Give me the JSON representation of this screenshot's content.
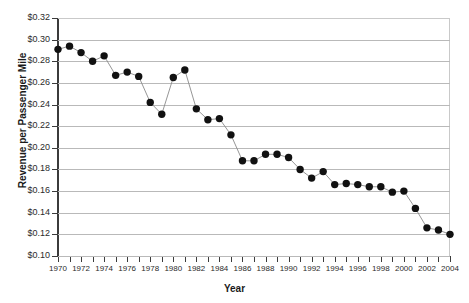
{
  "chart_data": {
    "type": "line",
    "title": "",
    "xlabel": "Year",
    "ylabel": "Revenue per Passenger Mile",
    "xlim": [
      1970,
      2004
    ],
    "ylim": [
      0.1,
      0.32
    ],
    "ytick_step": 0.02,
    "grid": true,
    "legend": "none",
    "marker": "filled-circle",
    "y_tick_labels": [
      "$0.10",
      "$0.12",
      "$0.14",
      "$0.16",
      "$0.18",
      "$0.20",
      "$0.22",
      "$0.24",
      "$0.26",
      "$0.28",
      "$0.30",
      "$0.32"
    ],
    "y_tick_values": [
      0.1,
      0.12,
      0.14,
      0.16,
      0.18,
      0.2,
      0.22,
      0.24,
      0.26,
      0.28,
      0.3,
      0.32
    ],
    "x_tick_labels": [
      "1970",
      "1972",
      "1974",
      "1976",
      "1978",
      "1980",
      "1982",
      "1984",
      "1986",
      "1988",
      "1990",
      "1992",
      "1994",
      "1996",
      "1998",
      "2000",
      "2002",
      "2004"
    ],
    "x_tick_values": [
      1970,
      1972,
      1974,
      1976,
      1978,
      1980,
      1982,
      1984,
      1986,
      1988,
      1990,
      1992,
      1994,
      1996,
      1998,
      2000,
      2002,
      2004
    ],
    "x_minor_ticks_every": 1,
    "x": [
      1970,
      1971,
      1972,
      1973,
      1974,
      1975,
      1976,
      1977,
      1978,
      1979,
      1980,
      1981,
      1982,
      1983,
      1984,
      1985,
      1986,
      1987,
      1988,
      1989,
      1990,
      1991,
      1992,
      1993,
      1994,
      1995,
      1996,
      1997,
      1998,
      1999,
      2000,
      2001,
      2002,
      2003,
      2004
    ],
    "values": [
      0.291,
      0.294,
      0.288,
      0.28,
      0.285,
      0.267,
      0.27,
      0.266,
      0.242,
      0.231,
      0.265,
      0.272,
      0.236,
      0.226,
      0.227,
      0.212,
      0.188,
      0.188,
      0.194,
      0.194,
      0.191,
      0.18,
      0.172,
      0.178,
      0.166,
      0.167,
      0.166,
      0.164,
      0.164,
      0.159,
      0.16,
      0.144,
      0.126,
      0.124,
      0.12
    ],
    "colors": {
      "marker": "#111111",
      "line": "#8a8a8a",
      "grid": "#b9b9b9",
      "axis": "#3b3b3b",
      "background": "#ffffff",
      "text": "#1a1a1a"
    }
  }
}
